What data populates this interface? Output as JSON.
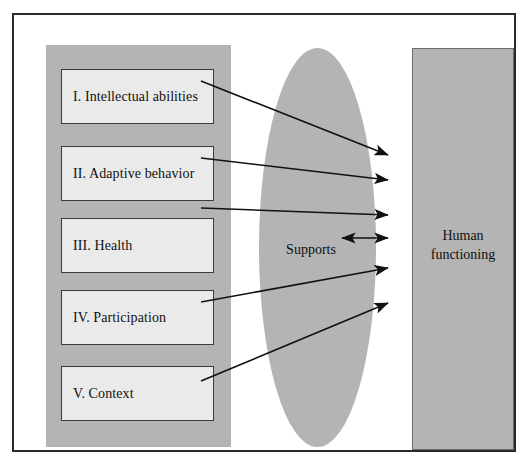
{
  "diagram": {
    "colors": {
      "panel_gray": "#b4b4b4",
      "box_fill": "#eaeaea",
      "box_border": "#3a3a3a",
      "frame_border": "#2a2a2a",
      "text": "#111111",
      "arrow": "#111111"
    },
    "left_panel": {
      "name": "five-dimensions-panel",
      "boxes": [
        {
          "id": "dim-1",
          "label": "I. Intellectual abilities"
        },
        {
          "id": "dim-2",
          "label": "II. Adaptive behavior"
        },
        {
          "id": "dim-3",
          "label": "III. Health"
        },
        {
          "id": "dim-4",
          "label": "IV. Participation"
        },
        {
          "id": "dim-5",
          "label": "V. Context"
        }
      ]
    },
    "middle": {
      "shape": "ellipse",
      "label": "Supports"
    },
    "right": {
      "shape": "rectangle",
      "label_line_1": "Human",
      "label_line_2": "functioning"
    },
    "arrows": [
      {
        "id": "arrow-dim-1",
        "from": "I. Intellectual abilities",
        "to": "Human functioning",
        "direction": "one-way"
      },
      {
        "id": "arrow-dim-2",
        "from": "II. Adaptive behavior",
        "to": "Human functioning",
        "direction": "one-way"
      },
      {
        "id": "arrow-dim-3",
        "from": "III. Health",
        "to": "Human functioning",
        "direction": "one-way"
      },
      {
        "id": "arrow-dim-4",
        "from": "IV. Participation",
        "to": "Human functioning",
        "direction": "one-way"
      },
      {
        "id": "arrow-dim-5",
        "from": "V. Context",
        "to": "Human functioning",
        "direction": "one-way"
      },
      {
        "id": "arrow-supports",
        "from": "Supports",
        "to": "Human functioning",
        "direction": "two-way"
      }
    ]
  }
}
